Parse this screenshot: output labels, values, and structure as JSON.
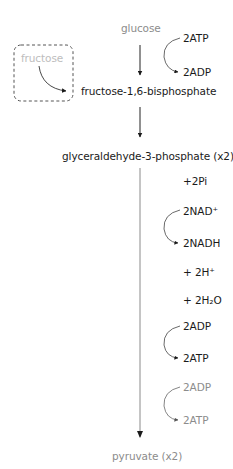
{
  "diagram": {
    "start": {
      "label": "glucose",
      "color": "#8c8c8c"
    },
    "side_input": {
      "label": "fructose",
      "color": "#bdbdbd",
      "box_style": "dashed"
    },
    "steps": [
      {
        "label": "fructose-1,6-bisphosphate"
      },
      {
        "label": "glyceraldehyde-3-phosphate (x2)"
      }
    ],
    "end": {
      "label": "pyruvate (x2)",
      "color": "#8c8c8c"
    },
    "cofactors_step1": {
      "in": "2ATP",
      "out": "2ADP"
    },
    "cofactors_step3": [
      {
        "label": "+2Pi"
      },
      {
        "in": "2NAD⁺",
        "out": "2NADH"
      },
      {
        "label": "+ 2H⁺"
      },
      {
        "label": "+ 2H₂O"
      },
      {
        "in": "2ADP",
        "out": "2ATP",
        "color": "#1a1a1a"
      },
      {
        "in": "2ADP",
        "out": "2ATP",
        "color": "#8c8c8c"
      }
    ],
    "colors": {
      "text": "#1a1a1a",
      "muted": "#8c8c8c",
      "faint": "#bdbdbd",
      "arrow": "#222222",
      "long_arrow": "#8a8a8a"
    }
  }
}
